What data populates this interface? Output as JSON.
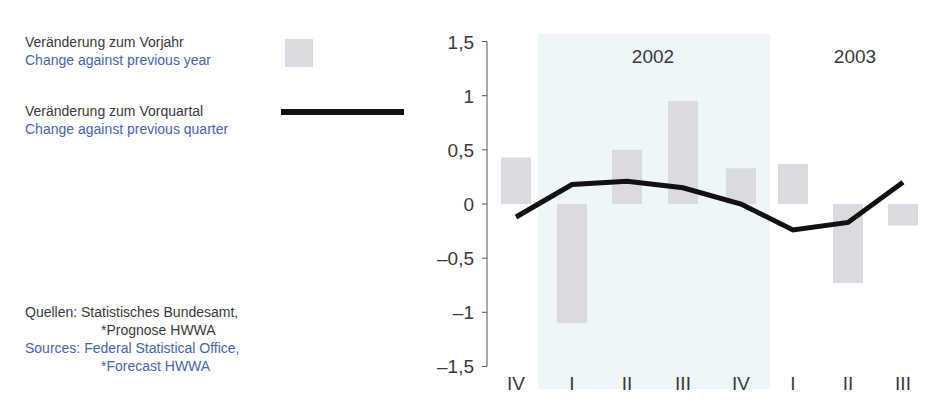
{
  "legend": {
    "bar": {
      "de": "Veränderung zum Vorjahr",
      "en": "Change against previous year"
    },
    "line": {
      "de": "Veränderung zum Vorquartal",
      "en": "Change against previous quarter"
    }
  },
  "sources": {
    "de_line1": "Quellen: Statistisches Bundesamt,",
    "de_line2": "*Prognose HWWA",
    "en_line1": "Sources: Federal Statistical Office,",
    "en_line2": "*Forecast HWWA"
  },
  "colors": {
    "bar": "#d9dbe0",
    "line": "#111111",
    "shade_2002": "#eef6fa",
    "text_de": "#3a3a3a",
    "text_en": "#4a63b0"
  },
  "chart_data": {
    "type": "bar",
    "title": "",
    "xlabel": "",
    "ylabel": "",
    "ylim": [
      -1.5,
      1.5
    ],
    "yticks": [
      "1,5",
      "1",
      "0,5",
      "0",
      "–0,5",
      "–1",
      "–1,5"
    ],
    "ytick_values": [
      1.5,
      1,
      0.5,
      0,
      -0.5,
      -1,
      -1.5
    ],
    "categories": [
      "IV",
      "I",
      "II",
      "III",
      "IV",
      "I",
      "II",
      "III"
    ],
    "year_groups": [
      {
        "label": "2002",
        "start_index": 1,
        "end_index": 4,
        "shaded": true
      },
      {
        "label": "2003",
        "start_index": 5,
        "end_index": 7,
        "shaded": false
      }
    ],
    "series": [
      {
        "name": "Veränderung zum Vorjahr / Change against previous year",
        "type": "bar",
        "values": [
          0.43,
          -1.1,
          0.5,
          0.95,
          0.33,
          0.37,
          -0.73,
          -0.2
        ]
      },
      {
        "name": "Veränderung zum Vorquartal / Change against previous quarter",
        "type": "line",
        "values": [
          -0.12,
          0.18,
          0.21,
          0.15,
          0.0,
          -0.24,
          -0.17,
          0.2
        ]
      }
    ],
    "grid": false,
    "legend_position": "left"
  }
}
